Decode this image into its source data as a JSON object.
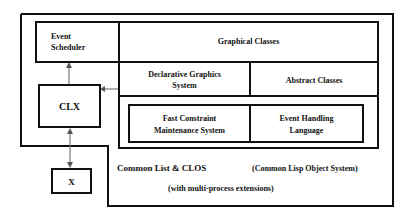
{
  "diagram": {
    "nodes": {
      "event_scheduler": "Event\nScheduler",
      "event_scheduler_l1": "Event",
      "event_scheduler_l2": "Scheduler",
      "graphical_classes": "Graphical Classes",
      "declarative_l1": "Declarative Graphics",
      "declarative_l2": "System",
      "abstract_classes": "Abstract Classes",
      "fast_l1": "Fast Constraint",
      "fast_l2": "Maintenance System",
      "event_handling_l1": "Event Handling",
      "event_handling_l2": "Language",
      "clx": "CLX",
      "x": "X"
    },
    "base": {
      "label": "Common List & CLOS",
      "note": "(Common Lisp Object System)",
      "sub": "(with multi-process extensions)"
    },
    "edges": [
      {
        "from": "clx",
        "to": "event_scheduler",
        "type": "arrow"
      },
      {
        "from": "declarative_graphics",
        "to": "clx",
        "type": "arrow"
      },
      {
        "from": "clx",
        "to": "x",
        "type": "bidirectional"
      }
    ]
  }
}
